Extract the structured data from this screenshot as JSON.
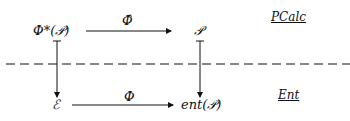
{
  "diagram": {
    "nodes": {
      "top_left": "Φ*(𝒫)",
      "top_right": "𝒫",
      "bottom_left": "ℰ",
      "bottom_right": "ent(𝒫)"
    },
    "edges": {
      "top": "Φ̂",
      "bottom": "Φ"
    },
    "regions": {
      "upper": "PCalc",
      "lower": "Ent"
    }
  }
}
